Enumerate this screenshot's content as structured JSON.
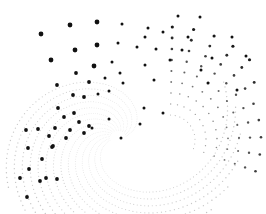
{
  "artwork": {
    "title": "Dot spiral pattern",
    "background": "#ffffff",
    "dot_color": "#111111",
    "faint_dot_color": "#9a9a9a",
    "center": [
      118,
      138
    ],
    "arms": 14,
    "dots_per_arm": 26,
    "prominent_dots": [
      [
        41,
        34
      ],
      [
        70,
        25
      ],
      [
        97,
        22
      ],
      [
        122,
        24
      ],
      [
        148,
        28
      ],
      [
        178,
        16
      ],
      [
        200,
        17
      ],
      [
        51,
        60
      ],
      [
        75,
        50
      ],
      [
        97,
        45
      ],
      [
        118,
        43
      ],
      [
        145,
        37
      ],
      [
        163,
        32
      ],
      [
        188,
        37
      ],
      [
        76,
        73
      ],
      [
        94,
        66
      ],
      [
        112,
        62
      ],
      [
        137,
        47
      ],
      [
        156,
        49
      ],
      [
        182,
        50
      ],
      [
        232,
        37
      ],
      [
        57,
        85
      ],
      [
        89,
        82
      ],
      [
        105,
        78
      ],
      [
        120,
        73
      ],
      [
        145,
        65
      ],
      [
        170,
        60
      ],
      [
        212,
        58
      ],
      [
        73,
        95
      ],
      [
        84,
        97
      ],
      [
        98,
        94
      ],
      [
        109,
        91
      ],
      [
        123,
        83
      ],
      [
        154,
        80
      ],
      [
        201,
        70
      ],
      [
        246,
        56
      ],
      [
        58,
        108
      ],
      [
        74,
        113
      ],
      [
        64,
        117
      ],
      [
        79,
        122
      ],
      [
        89,
        126
      ],
      [
        109,
        119
      ],
      [
        208,
        83
      ],
      [
        237,
        90
      ],
      [
        26,
        130
      ],
      [
        38,
        129
      ],
      [
        55,
        128
      ],
      [
        70,
        130
      ],
      [
        92,
        128
      ],
      [
        121,
        138
      ],
      [
        140,
        124
      ],
      [
        28,
        148
      ],
      [
        52,
        147
      ],
      [
        49,
        136
      ],
      [
        66,
        138
      ],
      [
        84,
        133
      ],
      [
        144,
        108
      ],
      [
        163,
        113
      ],
      [
        42,
        159
      ],
      [
        53,
        146
      ],
      [
        57,
        179
      ],
      [
        46,
        178
      ],
      [
        29,
        169
      ],
      [
        40,
        181
      ],
      [
        20,
        178
      ],
      [
        27,
        197
      ]
    ]
  }
}
